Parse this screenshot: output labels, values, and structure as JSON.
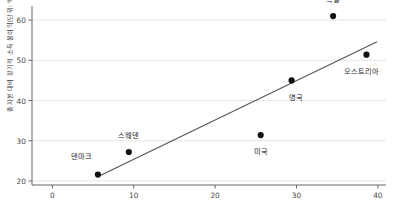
{
  "chart_data": {
    "type": "scatter",
    "title": "",
    "xlabel": "",
    "ylabel": "총자본 대비 장기적 소득 불이익(단위: %)",
    "xlim": [
      -2.5,
      41
    ],
    "ylim": [
      19,
      63.5
    ],
    "xticks": [
      "0",
      "10",
      "20",
      "30",
      "40"
    ],
    "xtick_values": [
      0,
      10,
      20,
      30,
      40
    ],
    "yticks": [
      "20",
      "30",
      "40",
      "50",
      "60"
    ],
    "ytick_values": [
      20,
      30,
      40,
      50,
      60
    ],
    "grid": "horizontal",
    "legend": "none",
    "point_color": "#111111",
    "line_color": "#555555",
    "points": [
      {
        "label": "덴마크",
        "x": 5.6,
        "y": 21.6,
        "label_dx": -2.0,
        "label_dy": 4.8
      },
      {
        "label": "스웨덴",
        "x": 9.4,
        "y": 27.2,
        "label_dx": 0.0,
        "label_dy": 4.6
      },
      {
        "label": "미국",
        "x": 25.6,
        "y": 31.4,
        "label_dx": 0.0,
        "label_dy": -3.6
      },
      {
        "label": "영국",
        "x": 29.4,
        "y": 45.0,
        "label_dx": 0.6,
        "label_dy": -3.8
      },
      {
        "label": "독일",
        "x": 34.5,
        "y": 61.0,
        "label_dx": 0.0,
        "label_dy": 4.4
      },
      {
        "label": "오스트리아",
        "x": 38.6,
        "y": 51.4,
        "label_dx": -0.6,
        "label_dy": -3.8
      }
    ],
    "trendline": {
      "x0": 5.7,
      "y0": 21.2,
      "x1": 39.9,
      "y1": 54.6
    },
    "annotations": []
  }
}
